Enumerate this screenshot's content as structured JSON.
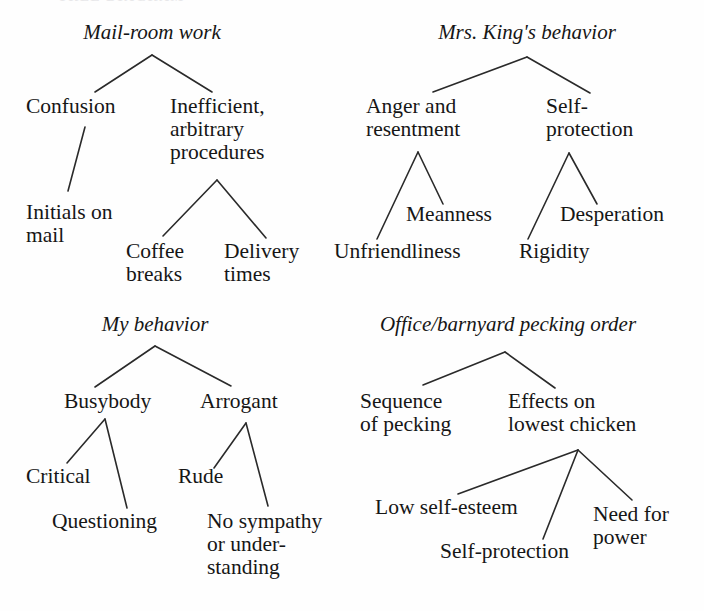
{
  "page": {
    "background": "#fefefe",
    "ink": "#161616",
    "cut_off_running_head": "TREE DIAGRAM",
    "width": 704,
    "height": 611
  },
  "trees": [
    {
      "id": "mail-room-work",
      "root": "Mail-room work",
      "nodes": [
        {
          "id": "confusion",
          "label": "Confusion"
        },
        {
          "id": "inefficient",
          "label": "Inefficient,\narbitrary\nprocedures"
        },
        {
          "id": "initials-on-mail",
          "label": "Initials on\nmail"
        },
        {
          "id": "coffee-breaks",
          "label": "Coffee\nbreaks"
        },
        {
          "id": "delivery-times",
          "label": "Delivery\ntimes"
        }
      ]
    },
    {
      "id": "mrs-kings-behavior",
      "root": "Mrs. King's behavior",
      "nodes": [
        {
          "id": "anger-and-resentment",
          "label": "Anger and\nresentment"
        },
        {
          "id": "self-protection-king",
          "label": "Self-\nprotection"
        },
        {
          "id": "meanness",
          "label": "Meanness"
        },
        {
          "id": "unfriendliness",
          "label": "Unfriendliness"
        },
        {
          "id": "desperation",
          "label": "Desperation"
        },
        {
          "id": "rigidity",
          "label": "Rigidity"
        }
      ]
    },
    {
      "id": "my-behavior",
      "root": "My behavior",
      "nodes": [
        {
          "id": "busybody",
          "label": "Busybody"
        },
        {
          "id": "arrogant",
          "label": "Arrogant"
        },
        {
          "id": "critical",
          "label": "Critical"
        },
        {
          "id": "questioning",
          "label": "Questioning"
        },
        {
          "id": "rude",
          "label": "Rude"
        },
        {
          "id": "no-sympathy",
          "label": "No sympathy\nor under-\nstanding"
        }
      ]
    },
    {
      "id": "office-barnyard-pecking-order",
      "root": "Office/barnyard pecking order",
      "nodes": [
        {
          "id": "sequence-of-pecking",
          "label": "Sequence\nof pecking"
        },
        {
          "id": "effects-on-lowest-chicken",
          "label": "Effects on\nlowest chicken"
        },
        {
          "id": "low-self-esteem",
          "label": "Low self-esteem"
        },
        {
          "id": "self-protection-chicken",
          "label": "Self-protection"
        },
        {
          "id": "need-for-power",
          "label": "Need for\npower"
        }
      ]
    }
  ]
}
